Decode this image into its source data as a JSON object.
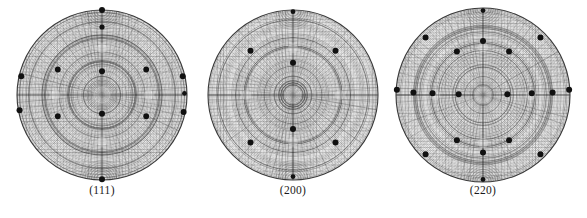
{
  "figure": {
    "type": "pole-figure-set",
    "background_color": "#ffffff",
    "pole_color": "#111111",
    "grid_color": "#5a5a5a",
    "outline_color": "#3a3a3a"
  },
  "panels": [
    {
      "id": "panel-111",
      "label": "(111)",
      "center": [
        102,
        95
      ],
      "radius": 85,
      "label_x": 102,
      "label_y": 190,
      "poles": [
        {
          "x": 0.0,
          "y": -1.0,
          "r": 3.0
        },
        {
          "x": 0.0,
          "y": -0.8,
          "r": 2.6
        },
        {
          "x": -0.95,
          "y": -0.22,
          "r": 3.0
        },
        {
          "x": -0.52,
          "y": -0.3,
          "r": 2.9
        },
        {
          "x": 0.0,
          "y": -0.28,
          "r": 3.0
        },
        {
          "x": 0.52,
          "y": -0.3,
          "r": 2.9
        },
        {
          "x": 0.95,
          "y": -0.22,
          "r": 3.0
        },
        {
          "x": 0.97,
          "y": -0.02,
          "r": 2.4
        },
        {
          "x": -0.97,
          "y": 0.18,
          "r": 3.0
        },
        {
          "x": -0.52,
          "y": 0.25,
          "r": 2.9
        },
        {
          "x": 0.0,
          "y": 0.22,
          "r": 3.0
        },
        {
          "x": 0.52,
          "y": 0.25,
          "r": 2.9
        },
        {
          "x": 0.96,
          "y": 0.2,
          "r": 3.0
        },
        {
          "x": 0.0,
          "y": 0.99,
          "r": 3.0
        }
      ]
    },
    {
      "id": "panel-200",
      "label": "(200)",
      "center": [
        293,
        95
      ],
      "radius": 85,
      "label_x": 293,
      "label_y": 190,
      "poles": [
        {
          "x": 0.0,
          "y": -0.98,
          "r": 2.4
        },
        {
          "x": -0.5,
          "y": -0.52,
          "r": 3.0
        },
        {
          "x": 0.5,
          "y": -0.52,
          "r": 3.0
        },
        {
          "x": 0.0,
          "y": -0.38,
          "r": 3.0
        },
        {
          "x": 0.0,
          "y": 0.4,
          "r": 3.0
        },
        {
          "x": -0.5,
          "y": 0.56,
          "r": 3.0
        },
        {
          "x": 0.5,
          "y": 0.56,
          "r": 3.0
        },
        {
          "x": 0.0,
          "y": 0.96,
          "r": 2.4
        }
      ]
    },
    {
      "id": "panel-220",
      "label": "(220)",
      "center": [
        483,
        95
      ],
      "radius": 87,
      "label_x": 483,
      "label_y": 190,
      "poles": [
        {
          "x": 0.0,
          "y": -0.97,
          "r": 2.4
        },
        {
          "x": 0.0,
          "y": -0.62,
          "r": 3.0
        },
        {
          "x": -0.3,
          "y": -0.5,
          "r": 3.0
        },
        {
          "x": 0.3,
          "y": -0.5,
          "r": 3.0
        },
        {
          "x": -0.66,
          "y": -0.66,
          "r": 3.0
        },
        {
          "x": 0.66,
          "y": -0.66,
          "r": 3.0
        },
        {
          "x": -0.99,
          "y": -0.06,
          "r": 3.0
        },
        {
          "x": -0.8,
          "y": -0.03,
          "r": 3.0
        },
        {
          "x": -0.58,
          "y": -0.02,
          "r": 3.0
        },
        {
          "x": -0.28,
          "y": -0.01,
          "r": 3.0
        },
        {
          "x": 0.28,
          "y": -0.01,
          "r": 3.0
        },
        {
          "x": 0.56,
          "y": -0.02,
          "r": 3.0
        },
        {
          "x": 0.8,
          "y": -0.03,
          "r": 3.0
        },
        {
          "x": 0.99,
          "y": -0.06,
          "r": 3.0
        },
        {
          "x": -0.3,
          "y": 0.52,
          "r": 3.0
        },
        {
          "x": 0.3,
          "y": 0.52,
          "r": 3.0
        },
        {
          "x": -0.66,
          "y": 0.68,
          "r": 3.0
        },
        {
          "x": 0.66,
          "y": 0.68,
          "r": 3.0
        },
        {
          "x": 0.0,
          "y": 0.66,
          "r": 3.0
        },
        {
          "x": 0.0,
          "y": 0.97,
          "r": 2.4
        }
      ]
    }
  ],
  "chart_data": {
    "type": "scatter",
    "title": "",
    "subtitle": "",
    "xlabel": "",
    "ylabel": "",
    "projection": "stereographic",
    "grid": true,
    "legend": "none",
    "panel_labels": [
      "(111)",
      "(200)",
      "(220)"
    ],
    "panel_pole_counts": [
      14,
      8,
      20
    ],
    "note": "Normalized stereographic coordinates; x,y in [-1,1] relative to unit circle radius"
  }
}
